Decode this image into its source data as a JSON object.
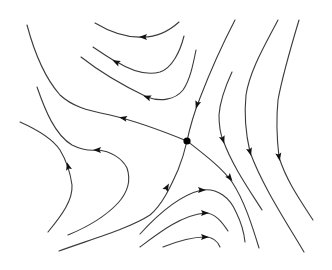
{
  "diagram": {
    "type": "phase-portrait",
    "title": "",
    "colors": {
      "background": "#ffffff",
      "stroke": "#3a3a3a",
      "arrow": "#111111",
      "point": "#000000"
    },
    "saddle_point": {
      "x": 187,
      "y": 141,
      "r": 3.6
    },
    "trajectories": [
      {
        "id": "unstable-left",
        "d": "M187,141 C165,132 140,122 110,115 C85,110 72,106 60,95 C45,78 35,55 27,25",
        "arrows": [
          {
            "x": 123,
            "y": 118,
            "angle": 192
          }
        ]
      },
      {
        "id": "unstable-right",
        "d": "M187,141 C205,155 222,168 232,182 C244,200 252,225 259,248",
        "arrows": [
          {
            "x": 230,
            "y": 178,
            "angle": 52
          }
        ]
      },
      {
        "id": "stable-top",
        "d": "M235,20 C222,45 210,72 200,98 C194,113 190,127 187,141",
        "arrows": [
          {
            "x": 197,
            "y": 105,
            "angle": 108
          }
        ]
      },
      {
        "id": "stable-bottom",
        "d": "M59,251 C95,238 130,228 150,215 C162,205 170,188 178,170 C182,160 185,150 187,141",
        "arrows": [
          {
            "x": 167,
            "y": 187,
            "angle": -60
          }
        ]
      },
      {
        "id": "top-curve-1",
        "d": "M95,23 C110,32 125,38 143,37 C155,37 168,32 179,22",
        "arrows": [
          {
            "x": 143,
            "y": 37,
            "angle": 180
          }
        ]
      },
      {
        "id": "top-curve-2",
        "d": "M93,47 C105,55 112,60 117,62 C130,70 145,76 160,72 C172,68 180,52 184,36",
        "arrows": [
          {
            "x": 116,
            "y": 62,
            "angle": 205
          }
        ]
      },
      {
        "id": "top-curve-3",
        "d": "M81,57 C100,72 122,85 147,97 C160,102 175,100 183,90 C190,80 193,65 196,50",
        "arrows": [
          {
            "x": 147,
            "y": 97,
            "angle": 200
          }
        ]
      },
      {
        "id": "left-curve-1",
        "d": "M20,122 C38,130 52,138 60,150 C66,160 70,170 72,185 C73,200 62,215 48,232",
        "arrows": [
          {
            "x": 68,
            "y": 166,
            "angle": -105
          }
        ]
      },
      {
        "id": "left-curve-2",
        "d": "M37,87 C45,110 55,135 72,145 C82,150 90,151 98,150 C110,151 122,158 127,168 C131,180 128,192 118,203 C104,218 85,228 68,235",
        "arrows": [
          {
            "x": 97,
            "y": 150,
            "angle": 180
          }
        ]
      },
      {
        "id": "right-curve-1",
        "d": "M232,72 C226,85 220,100 219,115 C219,125 220,133 223,140 C232,165 248,188 262,210",
        "arrows": [
          {
            "x": 223,
            "y": 140,
            "angle": 72
          }
        ]
      },
      {
        "id": "right-curve-2",
        "d": "M278,20 C265,45 250,70 246,95 C244,115 246,135 250,152 C262,185 285,220 304,252",
        "arrows": [
          {
            "x": 250,
            "y": 152,
            "angle": 75
          }
        ]
      },
      {
        "id": "right-curve-3",
        "d": "M299,20 C290,50 282,78 278,100 C276,120 277,140 279,157 C286,180 300,200 313,220",
        "arrows": [
          {
            "x": 279,
            "y": 157,
            "angle": 80
          }
        ]
      },
      {
        "id": "bottom-curve-1",
        "d": "M140,234 C160,212 180,195 202,190 C218,188 230,198 236,212 C241,222 244,232 245,242",
        "arrows": [
          {
            "x": 202,
            "y": 190,
            "angle": 0
          }
        ]
      },
      {
        "id": "bottom-curve-2",
        "d": "M140,247 C160,232 182,215 205,213 C215,213 222,222 228,231",
        "arrows": [
          {
            "x": 205,
            "y": 213,
            "angle": 0
          }
        ]
      },
      {
        "id": "bottom-curve-3",
        "d": "M163,247 C178,241 192,237 205,237 C213,237 218,242 220,247",
        "arrows": [
          {
            "x": 205,
            "y": 237,
            "angle": 0
          }
        ]
      }
    ]
  }
}
